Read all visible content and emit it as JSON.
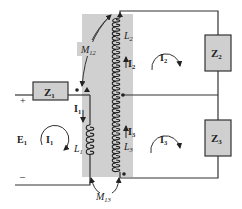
{
  "diagram": {
    "type": "circuit",
    "colors": {
      "core_shade": "#d0d0d0",
      "impedance_fill": "#cfcfcf",
      "wire": "#333333",
      "background": "#ffffff"
    },
    "source": {
      "label": "E",
      "subscript": "1",
      "plus": "+",
      "minus": "–"
    },
    "impedances": [
      {
        "id": "Z1",
        "label": "Z",
        "subscript": "1"
      },
      {
        "id": "Z2",
        "label": "Z",
        "subscript": "2"
      },
      {
        "id": "Z3",
        "label": "Z",
        "subscript": "3"
      }
    ],
    "inductors": [
      {
        "id": "L1",
        "label": "L",
        "subscript": "1"
      },
      {
        "id": "L2",
        "label": "L",
        "subscript": "2"
      },
      {
        "id": "L3",
        "label": "L",
        "subscript": "3"
      }
    ],
    "mutual_inductances": [
      {
        "id": "M12",
        "label": "M",
        "subscript": "12"
      },
      {
        "id": "M13",
        "label": "M",
        "subscript": "13"
      }
    ],
    "branch_currents": [
      {
        "id": "I1_branch",
        "label": "I",
        "subscript": "1"
      },
      {
        "id": "I2_branch",
        "label": "I",
        "subscript": "2"
      },
      {
        "id": "I3_branch",
        "label": "I",
        "subscript": "3"
      }
    ],
    "mesh_currents": [
      {
        "id": "I1_loop",
        "label": "I",
        "subscript": "1",
        "direction": "clockwise"
      },
      {
        "id": "I2_loop",
        "label": "I",
        "subscript": "2",
        "direction": "clockwise"
      },
      {
        "id": "I3_loop",
        "label": "I",
        "subscript": "3",
        "direction": "clockwise"
      }
    ]
  }
}
